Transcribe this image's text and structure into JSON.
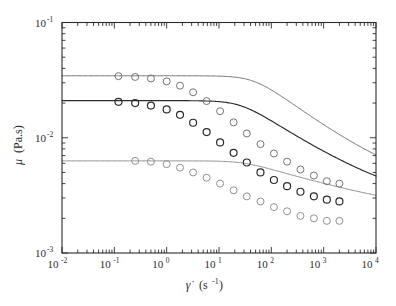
{
  "chart_data": {
    "type": "line",
    "title": "",
    "subtitle": "",
    "xlabel": "γ̇(s⁻¹)",
    "xlabel_symbol": "γ̇",
    "xlabel_unit": "(s",
    "xlabel_unit_exp": "-1",
    "xlabel_unit_close": ")",
    "ylabel": "μ (Pa.s)",
    "ylabel_symbol": "μ",
    "ylabel_unit": "(Pa.s)",
    "xscale": "log",
    "yscale": "log",
    "xlim": [
      0.01,
      10000
    ],
    "ylim": [
      0.001,
      0.1
    ],
    "grid": false,
    "legend": "none",
    "x_tick_labels": [
      "10⁻²",
      "10⁻¹",
      "10⁰",
      "10¹",
      "10²",
      "10³",
      "10⁴"
    ],
    "x_tick_bases": [
      "10",
      "10",
      "10",
      "10",
      "10",
      "10",
      "10"
    ],
    "x_tick_exps": [
      "-2",
      "-1",
      "0",
      "1",
      "2",
      "3",
      "4"
    ],
    "x_tick_values": [
      0.01,
      0.1,
      1,
      10,
      100,
      1000,
      10000
    ],
    "y_tick_labels": [
      "10⁻¹",
      "10⁻²",
      "10⁻³"
    ],
    "y_tick_bases": [
      "10",
      "10",
      "10"
    ],
    "y_tick_exps": [
      "-1",
      "-2",
      "-3"
    ],
    "y_tick_values": [
      0.1,
      0.01,
      0.001
    ],
    "marker": "open-circle",
    "marker_size_px": 7,
    "series": [
      {
        "name": "upper-curve",
        "color": "#6e6e6e",
        "zero_shear_viscosity": 0.0345,
        "infinite_shear_viscosity": 0.0027,
        "x": [
          0.12,
          0.25,
          0.5,
          1.0,
          1.8,
          3.2,
          5.8,
          10.5,
          19,
          34,
          62,
          112,
          200,
          360,
          650,
          1150,
          2000
        ],
        "y": [
          0.0342,
          0.0337,
          0.0327,
          0.0308,
          0.0283,
          0.0248,
          0.0208,
          0.017,
          0.0136,
          0.0109,
          0.0088,
          0.0073,
          0.0062,
          0.0053,
          0.0047,
          0.0042,
          0.004
        ]
      },
      {
        "name": "middle-curve",
        "color": "#2b2b2b",
        "zero_shear_viscosity": 0.021,
        "infinite_shear_viscosity": 0.0021,
        "x": [
          0.12,
          0.25,
          0.5,
          1.0,
          1.8,
          3.2,
          5.8,
          10.5,
          19,
          34,
          62,
          112,
          200,
          360,
          650,
          1150,
          2000
        ],
        "y": [
          0.0205,
          0.02,
          0.019,
          0.0176,
          0.0158,
          0.0135,
          0.0112,
          0.0091,
          0.0074,
          0.0061,
          0.005,
          0.0043,
          0.0038,
          0.0034,
          0.0031,
          0.0029,
          0.0028
        ]
      },
      {
        "name": "lower-curve",
        "color": "#8a8a8a",
        "zero_shear_viscosity": 0.0063,
        "infinite_shear_viscosity": 0.0016,
        "x": [
          0.25,
          0.5,
          1.0,
          1.8,
          3.2,
          5.8,
          10.5,
          19,
          34,
          62,
          112,
          200,
          360,
          650,
          1150,
          2000
        ],
        "y": [
          0.0063,
          0.0062,
          0.0059,
          0.0055,
          0.005,
          0.0045,
          0.004,
          0.0035,
          0.0031,
          0.0028,
          0.0025,
          0.0023,
          0.0021,
          0.002,
          0.0019,
          0.0019
        ]
      }
    ]
  },
  "figure": {
    "background": "#ffffff",
    "frame_color": "#2b2b2b",
    "tick_color": "#2b2b2b"
  }
}
